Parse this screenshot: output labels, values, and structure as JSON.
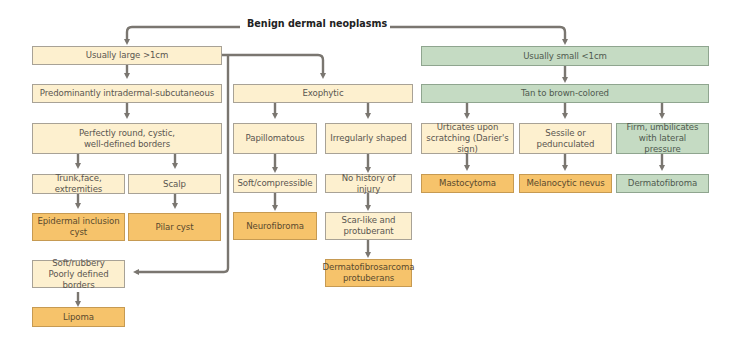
{
  "title": "Benign dermal neoplasms",
  "colors": {
    "cream": "#fdf0cf",
    "orange_diagnosis": "#f6c36b",
    "green": "#c5dbc3",
    "connector": "#7a7670"
  },
  "nodes": {
    "large": "Usually large >1cm",
    "intradermal": "Predominantly intradermal-subcutaneous",
    "round_cystic": "Perfectly round, cystic,\nwell-defined borders",
    "trunk": "Trunk,face, extremities",
    "scalp": "Scalp",
    "epidermal_cyst": "Epidermal inclusion\ncyst",
    "pilar_cyst": "Pilar cyst",
    "soft_rubbery": "Soft/rubbery\nPoorly defined borders",
    "lipoma": "Lipoma",
    "exophytic": "Exophytic",
    "papillomatous": "Papillomatous",
    "soft_compressible": "Soft/compressible",
    "neurofibroma": "Neurofibroma",
    "irregular": "Irregularly shaped",
    "no_injury": "No history of injury",
    "scar_like": "Scar-like and\nprotuberant",
    "dfsp": "Dermatofibrosarcoma\nprotuberans",
    "small": "Usually small <1cm",
    "tan_brown": "Tan to brown-colored",
    "urticates": "Urticates upon\nscratching (Darier's sign)",
    "sessile": "Sessile or\npedunculated",
    "firm": "Firm, umbilicates\nwith lateral pressure",
    "mastocytoma": "Mastocytoma",
    "melanocytic_nevus": "Melanocytic nevus",
    "dermatofibroma": "Dermatofibroma"
  }
}
